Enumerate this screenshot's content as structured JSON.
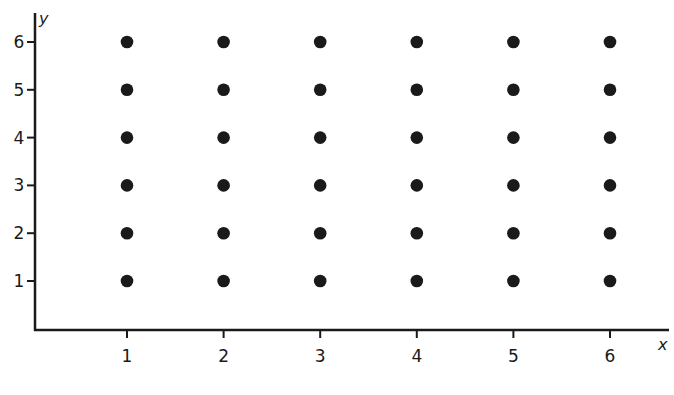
{
  "chart_data": {
    "type": "scatter",
    "title": "",
    "xlabel": "x",
    "ylabel": "y",
    "xlim": [
      0,
      6.5
    ],
    "ylim": [
      0,
      6.5
    ],
    "grid": false,
    "legend": null,
    "x_ticks": [
      "1",
      "2",
      "3",
      "4",
      "5",
      "6"
    ],
    "y_ticks": [
      "1",
      "2",
      "3",
      "4",
      "5",
      "6"
    ],
    "series": [
      {
        "name": "lattice points",
        "points": [
          [
            1,
            1
          ],
          [
            2,
            1
          ],
          [
            3,
            1
          ],
          [
            4,
            1
          ],
          [
            5,
            1
          ],
          [
            6,
            1
          ],
          [
            1,
            2
          ],
          [
            2,
            2
          ],
          [
            3,
            2
          ],
          [
            4,
            2
          ],
          [
            5,
            2
          ],
          [
            6,
            2
          ],
          [
            1,
            3
          ],
          [
            2,
            3
          ],
          [
            3,
            3
          ],
          [
            4,
            3
          ],
          [
            5,
            3
          ],
          [
            6,
            3
          ],
          [
            1,
            4
          ],
          [
            2,
            4
          ],
          [
            3,
            4
          ],
          [
            4,
            4
          ],
          [
            5,
            4
          ],
          [
            6,
            4
          ],
          [
            1,
            5
          ],
          [
            2,
            5
          ],
          [
            3,
            5
          ],
          [
            4,
            5
          ],
          [
            5,
            5
          ],
          [
            6,
            5
          ],
          [
            1,
            6
          ],
          [
            2,
            6
          ],
          [
            3,
            6
          ],
          [
            4,
            6
          ],
          [
            5,
            6
          ],
          [
            6,
            6
          ]
        ]
      }
    ]
  },
  "style": {
    "ink": "#1a1a1a",
    "background": "#ffffff"
  }
}
